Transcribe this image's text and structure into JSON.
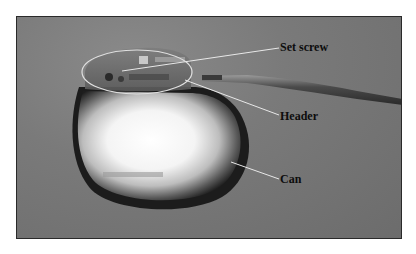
{
  "figure": {
    "labels": {
      "set_screw": "Set screw",
      "header": "Header",
      "can": "Can"
    },
    "colors": {
      "background": "#7a7a7a",
      "frame_border": "#2a2a2a",
      "callout_line": "#e8e8e8",
      "label_text": "#0d0d0d"
    }
  }
}
